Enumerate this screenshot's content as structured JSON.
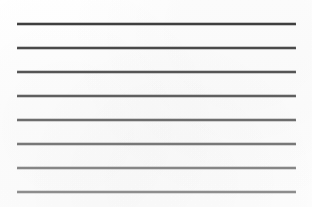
{
  "document": {
    "kind": "scanned-ruled-paper",
    "title": "Blank Ruled Paper",
    "background_color": "#fefefe",
    "width": 312,
    "height": 207,
    "text_content": "",
    "has_text": false
  },
  "ruling": {
    "line_count": 8,
    "left_margin_x": 17,
    "right_margin_x": 296,
    "line_length": 279,
    "line_spacing": 24,
    "line_thickness": 1.5,
    "first_line_y": 23,
    "last_line_y": 191,
    "orientation": "horizontal"
  },
  "lines": [
    {
      "index": 1,
      "y": 23,
      "x_start": 17,
      "x_end": 296,
      "color": "#3f3f3f",
      "thickness": 1.6
    },
    {
      "index": 2,
      "y": 47,
      "x_start": 17,
      "x_end": 296,
      "color": "#4a4a4a",
      "thickness": 1.6
    },
    {
      "index": 3,
      "y": 71,
      "x_start": 17,
      "x_end": 296,
      "color": "#555555",
      "thickness": 1.5
    },
    {
      "index": 4,
      "y": 95,
      "x_start": 17,
      "x_end": 296,
      "color": "#5f5f5f",
      "thickness": 1.5
    },
    {
      "index": 5,
      "y": 119,
      "x_start": 17,
      "x_end": 296,
      "color": "#6d6d6d",
      "thickness": 1.5
    },
    {
      "index": 6,
      "y": 143,
      "x_start": 17,
      "x_end": 296,
      "color": "#787878",
      "thickness": 1.5
    },
    {
      "index": 7,
      "y": 167,
      "x_start": 17,
      "x_end": 296,
      "color": "#868686",
      "thickness": 1.5
    },
    {
      "index": 8,
      "y": 191,
      "x_start": 17,
      "x_end": 296,
      "color": "#8d8d8d",
      "thickness": 1.5
    }
  ]
}
